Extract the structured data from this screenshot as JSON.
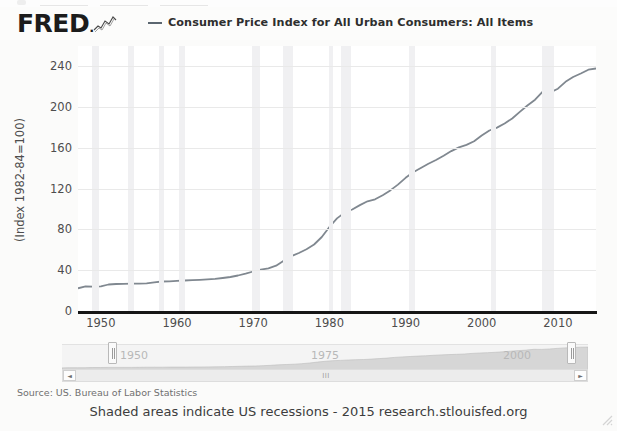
{
  "header": {
    "logo_text": "FRED",
    "logo_icon": "fred-squiggle-icon",
    "legend_label": "Consumer Price Index for All Urban Consumers: All Items",
    "line_color": "#5b6670"
  },
  "axes": {
    "y_title": "(Index 1982-84=100)",
    "y_ticks": [
      "240",
      "200",
      "160",
      "120",
      "80",
      "40",
      "0"
    ],
    "x_ticks": [
      "1950",
      "1960",
      "1970",
      "1980",
      "1990",
      "2000",
      "2010"
    ]
  },
  "navigator": {
    "years": [
      "1950",
      "1975",
      "2000"
    ],
    "left_arrow": "◄",
    "right_arrow": "►",
    "grip": "III"
  },
  "footer": {
    "source": "Source: US. Bureau of Labor Statistics",
    "note": "Shaded areas indicate US recessions - 2015 research.stlouisfed.org"
  },
  "chart_data": {
    "type": "line",
    "title": "Consumer Price Index for All Urban Consumers: All Items",
    "xlabel": "",
    "ylabel": "(Index 1982-84=100)",
    "xlim": [
      1947,
      2015
    ],
    "ylim": [
      0,
      260
    ],
    "yticks": [
      0,
      40,
      80,
      120,
      160,
      200,
      240
    ],
    "xticks": [
      1950,
      1960,
      1970,
      1980,
      1990,
      2000,
      2010
    ],
    "grid": true,
    "legend_position": "top",
    "line_color": "#808890",
    "series": [
      {
        "name": "Consumer Price Index for All Urban Consumers: All Items",
        "x": [
          1947,
          1948,
          1949,
          1950,
          1951,
          1952,
          1953,
          1954,
          1955,
          1956,
          1957,
          1958,
          1959,
          1960,
          1961,
          1962,
          1963,
          1964,
          1965,
          1966,
          1967,
          1968,
          1969,
          1970,
          1971,
          1972,
          1973,
          1974,
          1975,
          1976,
          1977,
          1978,
          1979,
          1980,
          1981,
          1982,
          1983,
          1984,
          1985,
          1986,
          1987,
          1988,
          1989,
          1990,
          1991,
          1992,
          1993,
          1994,
          1995,
          1996,
          1997,
          1998,
          1999,
          2000,
          2001,
          2002,
          2003,
          2004,
          2005,
          2006,
          2007,
          2008,
          2009,
          2010,
          2011,
          2012,
          2013,
          2014,
          2015
        ],
        "y": [
          22.3,
          24.1,
          23.8,
          24.1,
          26.0,
          26.5,
          26.7,
          26.9,
          26.8,
          27.2,
          28.1,
          28.9,
          29.1,
          29.6,
          29.9,
          30.2,
          30.6,
          31.0,
          31.5,
          32.4,
          33.4,
          34.8,
          36.7,
          38.8,
          40.5,
          41.8,
          44.4,
          49.3,
          53.8,
          56.9,
          60.6,
          65.2,
          72.6,
          82.4,
          90.9,
          96.5,
          99.6,
          103.9,
          107.6,
          109.6,
          113.6,
          118.3,
          124.0,
          130.7,
          136.2,
          140.3,
          144.5,
          148.2,
          152.4,
          156.9,
          160.5,
          163.0,
          166.6,
          172.2,
          177.1,
          179.9,
          184.0,
          188.9,
          195.3,
          201.6,
          207.3,
          215.3,
          214.5,
          218.1,
          224.9,
          229.6,
          233.0,
          236.7,
          237.9
        ]
      }
    ],
    "recession_bands": [
      [
        1948.9,
        1949.8
      ],
      [
        1953.5,
        1954.4
      ],
      [
        1957.6,
        1958.3
      ],
      [
        1960.3,
        1961.1
      ],
      [
        1969.9,
        1970.9
      ],
      [
        1973.9,
        1975.2
      ],
      [
        1980.0,
        1980.5
      ],
      [
        1981.5,
        1982.9
      ],
      [
        1990.5,
        1991.2
      ],
      [
        2001.2,
        2001.9
      ],
      [
        2007.9,
        2009.5
      ]
    ]
  }
}
